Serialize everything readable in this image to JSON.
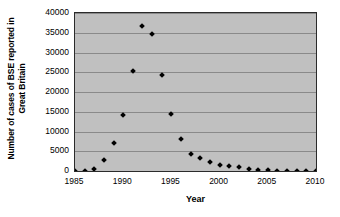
{
  "chart_data": {
    "type": "scatter",
    "title": "",
    "xlabel": "Year",
    "ylabel": "Number of cases of BSE reported in Great Britain",
    "ylabel_line1": "Number of cases of BSE reported in",
    "ylabel_line2": "Great Britain",
    "xlim": [
      1985,
      2010
    ],
    "ylim": [
      0,
      40000
    ],
    "xticks": [
      1985,
      1990,
      1995,
      2000,
      2005,
      2010
    ],
    "xtick_labels": [
      "1985",
      "1990",
      "1995",
      "2000",
      "2005",
      "2010"
    ],
    "yticks": [
      0,
      5000,
      10000,
      15000,
      20000,
      25000,
      30000,
      35000,
      40000
    ],
    "ytick_labels": [
      "0",
      "5000",
      "10000",
      "15000",
      "20000",
      "25000",
      "30000",
      "35000",
      "40000"
    ],
    "grid": "horizontal",
    "legend": "none",
    "marker": "diamond",
    "marker_color": "#000000",
    "plot_background": "#c0c0c0",
    "figure_background": "#ffffff",
    "gridline_color": "#8a8a8a",
    "axis_color": "#2b2b2b",
    "x": [
      1985,
      1986,
      1987,
      1988,
      1989,
      1990,
      1991,
      1992,
      1993,
      1994,
      1995,
      1996,
      1997,
      1998,
      1999,
      2000,
      2001,
      2002,
      2003,
      2004,
      2005,
      2006,
      2007,
      2008,
      2009,
      2010
    ],
    "values": [
      0,
      0,
      450,
      2700,
      7200,
      14300,
      25200,
      36800,
      34600,
      24200,
      14400,
      8100,
      4400,
      3200,
      2300,
      1400,
      1200,
      1100,
      600,
      350,
      230,
      120,
      70,
      40,
      20,
      10
    ]
  }
}
